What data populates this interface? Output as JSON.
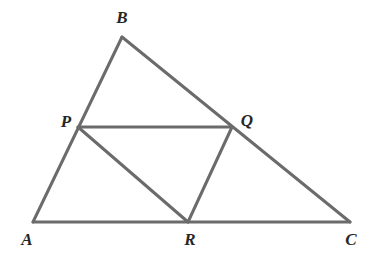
{
  "figure": {
    "type": "geometry-diagram",
    "canvas": {
      "width": 374,
      "height": 257
    },
    "style": {
      "background_color": "#ffffff",
      "line_color": "#6b6b6b",
      "line_width": 3,
      "label_color": "#262626",
      "label_font_size": 17
    },
    "points": [
      {
        "id": "A",
        "label": "A",
        "x": 33,
        "y": 222,
        "label_x": 27,
        "label_y": 239
      },
      {
        "id": "B",
        "label": "B",
        "x": 122,
        "y": 37,
        "label_x": 122,
        "label_y": 17
      },
      {
        "id": "C",
        "label": "C",
        "x": 350,
        "y": 222,
        "label_x": 351,
        "label_y": 239
      },
      {
        "id": "P",
        "label": "P",
        "x": 78,
        "y": 127,
        "label_x": 66,
        "label_y": 121
      },
      {
        "id": "Q",
        "label": "Q",
        "x": 232,
        "y": 127,
        "label_x": 247,
        "label_y": 120
      },
      {
        "id": "R",
        "label": "R",
        "x": 188,
        "y": 222,
        "label_x": 190,
        "label_y": 239
      }
    ],
    "segments": [
      {
        "id": "AB",
        "from": "A",
        "to": "B",
        "name": "side-ab"
      },
      {
        "id": "BC",
        "from": "B",
        "to": "C",
        "name": "side-bc"
      },
      {
        "id": "AC",
        "from": "A",
        "to": "C",
        "name": "side-ac"
      },
      {
        "id": "PQ",
        "from": "P",
        "to": "Q",
        "name": "segment-pq"
      },
      {
        "id": "PR",
        "from": "P",
        "to": "R",
        "name": "segment-pr"
      },
      {
        "id": "QR",
        "from": "Q",
        "to": "R",
        "name": "segment-qr"
      }
    ]
  }
}
